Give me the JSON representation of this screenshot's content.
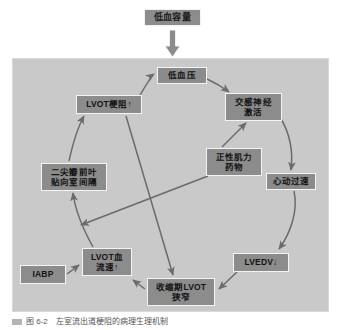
{
  "figure": {
    "title_node": {
      "label": "低血容量"
    },
    "caption": "图 6-2　左室流出道梗阻的病理生理机制",
    "colors": {
      "panel_background": "#c9c9c9",
      "node_fill": "#8c8c8c",
      "node_border": "#f4f4f4",
      "arrow": "#6b6b6b",
      "page_background": "#ffffff"
    }
  },
  "nodes": [
    {
      "id": "hypovolemia",
      "label": "低血容量",
      "role": "external-trigger"
    },
    {
      "id": "hypotension",
      "label": "低血压",
      "role": "state"
    },
    {
      "id": "lvot_obst",
      "label": "LVOT梗阻↑",
      "role": "state"
    },
    {
      "id": "symp",
      "label": "交感神经\n激活",
      "role": "state"
    },
    {
      "id": "inotrope",
      "label": "正性肌力\n药物",
      "role": "intervention"
    },
    {
      "id": "tachy",
      "label": "心动过速",
      "role": "state"
    },
    {
      "id": "sam",
      "label": "二尖瓣前叶\n贴向室间隔",
      "role": "state"
    },
    {
      "id": "lvot_vel",
      "label": "LVOT血\n流速↑",
      "role": "state"
    },
    {
      "id": "iabp",
      "label": "IABP",
      "role": "intervention"
    },
    {
      "id": "lvot_narrow",
      "label": "收缩期LVOT\n狭窄",
      "role": "state"
    },
    {
      "id": "lvedv",
      "label": "LVEDV↓",
      "role": "state"
    }
  ],
  "edges": [
    {
      "from": "hypovolemia",
      "to": "hypotension",
      "style": "block-arrow"
    },
    {
      "from": "hypotension",
      "to": "symp",
      "style": "curved"
    },
    {
      "from": "lvot_obst",
      "to": "hypotension",
      "style": "curved"
    },
    {
      "from": "symp",
      "to": "tachy",
      "style": "curved"
    },
    {
      "from": "inotrope",
      "to": "symp",
      "style": "straight"
    },
    {
      "from": "tachy",
      "to": "lvedv",
      "style": "curved"
    },
    {
      "from": "lvedv",
      "to": "lvot_narrow",
      "style": "straight"
    },
    {
      "from": "lvot_narrow",
      "to": "lvot_vel",
      "style": "straight"
    },
    {
      "from": "lvot_vel",
      "to": "sam",
      "style": "curved"
    },
    {
      "from": "sam",
      "to": "lvot_obst",
      "style": "curved"
    },
    {
      "from": "iabp",
      "to": "lvot_vel",
      "style": "straight"
    },
    {
      "from": "lvot_obst",
      "to": "lvot_narrow",
      "style": "straight"
    },
    {
      "from": "inotrope",
      "to": "lvot_vel",
      "style": "straight"
    }
  ]
}
